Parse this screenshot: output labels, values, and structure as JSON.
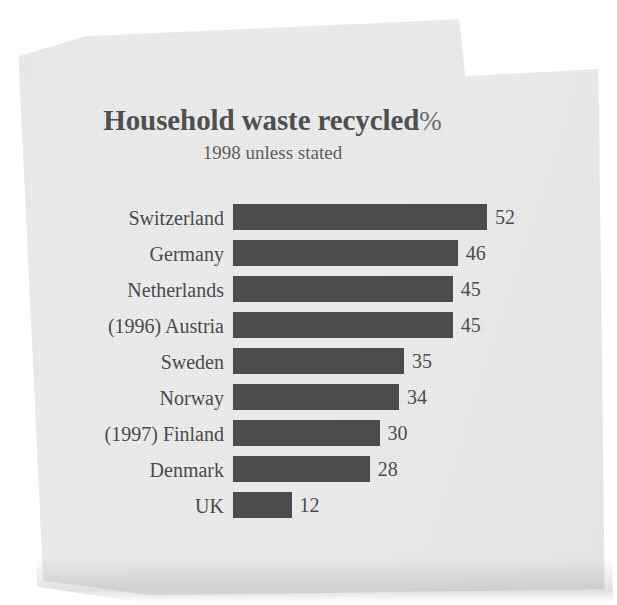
{
  "document": {
    "kind": "scanned-newspaper-clipping",
    "paper_color": "#ededee",
    "bar_color": "#4c4c4d",
    "text_color": "#4a4a4c"
  },
  "chart_data": {
    "type": "bar",
    "orientation": "horizontal",
    "title": "Household waste recycled",
    "title_suffix": "%",
    "subtitle": "1998 unless stated",
    "xlabel": "",
    "ylabel": "",
    "xlim": [
      0,
      52
    ],
    "grid": false,
    "legend": "none",
    "value_label_position": "outside-end",
    "categories": [
      "Switzerland",
      "Germany",
      "Netherlands",
      "(1996) Austria",
      "Sweden",
      "Norway",
      "(1997) Finland",
      "Denmark",
      "UK"
    ],
    "values": [
      52,
      46,
      45,
      45,
      35,
      34,
      30,
      28,
      12
    ],
    "value_labels": [
      "52",
      "46",
      "45",
      "45",
      "35",
      "34",
      "30",
      "28",
      "12"
    ],
    "notes": [
      "Austria figure is from 1996",
      "Finland figure is from 1997"
    ],
    "rows": [
      {
        "label": "Switzerland",
        "value": 52,
        "value_label": "52"
      },
      {
        "label": "Germany",
        "value": 46,
        "value_label": "46"
      },
      {
        "label": "Netherlands",
        "value": 45,
        "value_label": "45"
      },
      {
        "label": "(1996) Austria",
        "value": 45,
        "value_label": "45"
      },
      {
        "label": "Sweden",
        "value": 35,
        "value_label": "35"
      },
      {
        "label": "Norway",
        "value": 34,
        "value_label": "34"
      },
      {
        "label": "(1997) Finland",
        "value": 30,
        "value_label": "30"
      },
      {
        "label": "Denmark",
        "value": 28,
        "value_label": "28"
      },
      {
        "label": "UK",
        "value": 12,
        "value_label": "12"
      }
    ]
  }
}
